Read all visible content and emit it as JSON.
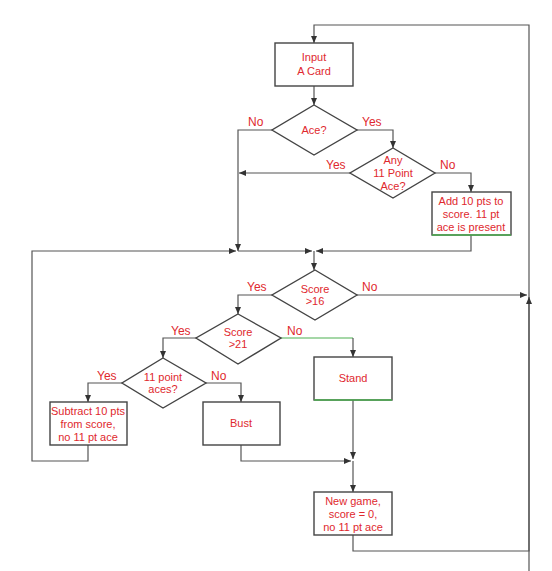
{
  "diagram": {
    "colors": {
      "text": "#e0282e",
      "stroke": "#444444",
      "accent_green": "#4caf50"
    },
    "nodes": {
      "input_card": {
        "type": "process",
        "lines": [
          "Input",
          "A Card"
        ]
      },
      "ace": {
        "type": "decision",
        "lines": [
          "Ace?"
        ]
      },
      "any_11_point_ace": {
        "type": "decision",
        "lines": [
          "Any",
          "11 Point",
          "Ace?"
        ]
      },
      "add_10_pts": {
        "type": "process",
        "lines": [
          "Add 10 pts to",
          "score. 11 pt",
          "ace is present"
        ]
      },
      "score_gt_16": {
        "type": "decision",
        "lines": [
          "Score",
          ">16"
        ]
      },
      "score_gt_21": {
        "type": "decision",
        "lines": [
          "Score",
          ">21"
        ]
      },
      "eleven_point_aces": {
        "type": "decision",
        "lines": [
          "11 point",
          "aces?"
        ]
      },
      "subtract_10_pts": {
        "type": "process",
        "lines": [
          "Subtract 10 pts",
          "from score,",
          "no 11 pt ace"
        ]
      },
      "bust": {
        "type": "process",
        "lines": [
          "Bust"
        ]
      },
      "stand": {
        "type": "process",
        "lines": [
          "Stand"
        ]
      },
      "new_game": {
        "type": "process",
        "lines": [
          "New game,",
          "score = 0,",
          "no 11 pt ace"
        ]
      }
    },
    "edge_labels": {
      "ace_no": "No",
      "ace_yes": "Yes",
      "any11_yes": "Yes",
      "any11_no": "No",
      "score16_yes": "Yes",
      "score16_no": "No",
      "score21_yes": "Yes",
      "score21_no": "No",
      "aces11_yes": "Yes",
      "aces11_no": "No"
    }
  }
}
